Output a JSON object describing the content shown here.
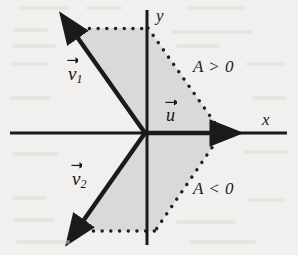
{
  "figure": {
    "background_color": "#f1f0ee",
    "ink_color": "#1a1a1a",
    "shade_color": "#d9d9d9",
    "axes": {
      "x_label": "x",
      "y_label": "y",
      "origin": {
        "x": 145,
        "y": 133
      },
      "x_axis": {
        "x1": 10,
        "y1": 133,
        "x2": 287,
        "y2": 133
      },
      "y_axis": {
        "x1": 147,
        "y1": 10,
        "x2": 147,
        "y2": 245
      }
    },
    "vectors": [
      {
        "name": "v1",
        "label": "v",
        "subscript": "1",
        "tip": {
          "x": 70,
          "y": 29
        },
        "label_pos": {
          "x": 68,
          "y": 63
        }
      },
      {
        "name": "v2",
        "label": "v",
        "subscript": "2",
        "tip": {
          "x": 76,
          "y": 229
        },
        "label_pos": {
          "x": 72,
          "y": 168
        }
      },
      {
        "name": "u",
        "label": "u",
        "subscript": "",
        "tip": {
          "x": 222,
          "y": 133
        },
        "label_pos": {
          "x": 166,
          "y": 104
        }
      }
    ],
    "regions": [
      {
        "name": "upper-region",
        "label": "A > 0",
        "label_pos": {
          "x": 193,
          "y": 58
        }
      },
      {
        "name": "lower-region",
        "label": "A < 0",
        "label_pos": {
          "x": 193,
          "y": 180
        }
      }
    ],
    "shaded_cone": {
      "points": "72,28 148,28 222,133 155,231 76,230 145,133",
      "description": "shaded wedge between v1, v2 and the dotted boundary"
    },
    "dotted_boundary": [
      {
        "name": "top-dotted-edge",
        "x1": 72,
        "y1": 28,
        "x2": 148,
        "y2": 28
      },
      {
        "name": "upper-right-dotted-edge",
        "x1": 148,
        "y1": 28,
        "x2": 222,
        "y2": 133
      },
      {
        "name": "lower-right-dotted-edge",
        "x1": 222,
        "y1": 133,
        "x2": 155,
        "y2": 231
      },
      {
        "name": "bottom-dotted-edge",
        "x1": 76,
        "y1": 231,
        "x2": 155,
        "y2": 231
      }
    ]
  }
}
